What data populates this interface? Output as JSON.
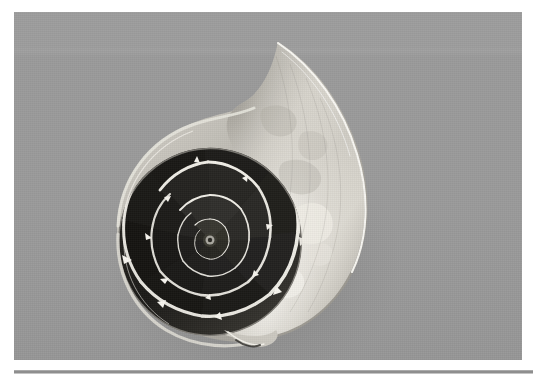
{
  "page": {
    "width": 536,
    "height": 381,
    "background_color": "#ffffff",
    "caption": ""
  },
  "photo": {
    "alt_text": "Nautilus shell cut in half lengthwise showing the logarithmic spiral of internal chambers",
    "subject": "nautilus-shell-cross-section",
    "color_mode": "grayscale",
    "background_color": "#9a9a9a",
    "frame": {
      "x": 14,
      "y": 12,
      "width": 508,
      "height": 348
    },
    "highlight_color": "#f2f0ea",
    "shadow_color": "#151515",
    "midtone_color": "#8a8780"
  },
  "shell": {
    "label": "nautilus-shell",
    "apex": {
      "x": 278,
      "y": 42
    },
    "leftmost": {
      "x": 113,
      "y": 237
    },
    "rightmost": {
      "x": 358,
      "y": 236
    },
    "bottom_tip": {
      "x": 237,
      "y": 335
    },
    "spiral_center": {
      "x": 196,
      "y": 228
    },
    "chamber_count": 30,
    "body_chamber_label": "living-chamber",
    "septa_label": "septa",
    "siphuncle_label": "siphuncle"
  },
  "rule": {
    "label": "horizontal-rule",
    "color": "#8e8e8e",
    "highlight_color": "#c4c4c4",
    "x": 14,
    "y": 370,
    "width": 519,
    "thickness": 4
  }
}
